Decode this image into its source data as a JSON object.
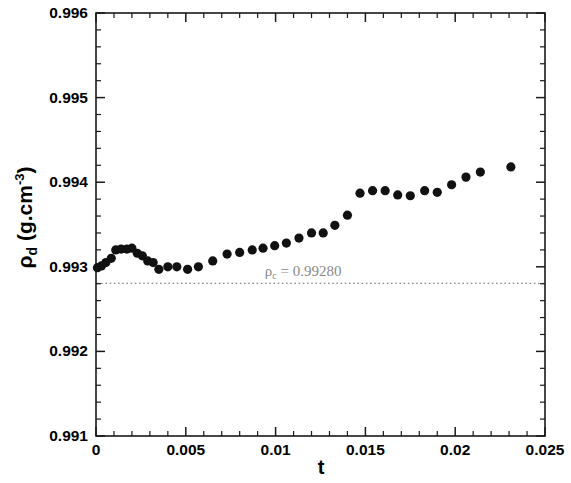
{
  "figure": {
    "background": "#ffffff",
    "frame_color": "#1a1a1a",
    "marker_color": "#111111",
    "annotation_color": "#8a8a8a"
  },
  "axes": {
    "y_label_rho": "ρ",
    "y_label_sub": "d",
    "y_label_unit": " (g.cm",
    "y_label_exp": "-3",
    "y_label_close": ")",
    "x_label": "t"
  },
  "annotation": {
    "rho_symbol": "ρ",
    "rho_sub": "c",
    "equals_value": " = 0.99280",
    "value": "0.99280",
    "x": 0.0094,
    "y": 0.992805
  },
  "chart_data": {
    "type": "scatter",
    "title": "",
    "xlabel": "t",
    "ylabel": "ρ_d (g.cm^-3)",
    "xlim": [
      0,
      0.025
    ],
    "ylim": [
      0.991,
      0.996
    ],
    "xticks": [
      0,
      0.005,
      0.01,
      0.015,
      0.02,
      0.025
    ],
    "xtick_labels": [
      "0",
      "0.005",
      "0.01",
      "0.015",
      "0.02",
      "0.025"
    ],
    "yticks": [
      0.991,
      0.992,
      0.993,
      0.994,
      0.995,
      0.996
    ],
    "ytick_labels": [
      "0.991",
      "0.992",
      "0.993",
      "0.994",
      "0.995",
      "0.996"
    ],
    "minor_ticks_per_interval": 5,
    "grid": false,
    "legend": null,
    "marker": "circle",
    "marker_size": 8,
    "hline": {
      "y": 0.992805,
      "style": "dotted",
      "color": "#8a8a8a",
      "label": "ρ_c = 0.99280"
    },
    "series": [
      {
        "name": "rho_d",
        "points": [
          [
            8e-05,
            0.99299
          ],
          [
            0.0003,
            0.99301
          ],
          [
            0.00055,
            0.99305
          ],
          [
            0.00085,
            0.9931
          ],
          [
            0.0011,
            0.9932
          ],
          [
            0.0014,
            0.99321
          ],
          [
            0.00172,
            0.99321
          ],
          [
            0.002,
            0.99322
          ],
          [
            0.0023,
            0.99316
          ],
          [
            0.00258,
            0.99313
          ],
          [
            0.00288,
            0.99307
          ],
          [
            0.00318,
            0.99305
          ],
          [
            0.0035,
            0.99297
          ],
          [
            0.004,
            0.993
          ],
          [
            0.0045,
            0.993
          ],
          [
            0.0051,
            0.99297
          ],
          [
            0.0057,
            0.993
          ],
          [
            0.0065,
            0.99307
          ],
          [
            0.0073,
            0.99315
          ],
          [
            0.008,
            0.99317
          ],
          [
            0.0087,
            0.9932
          ],
          [
            0.0093,
            0.99322
          ],
          [
            0.00995,
            0.99325
          ],
          [
            0.0106,
            0.99328
          ],
          [
            0.0113,
            0.99334
          ],
          [
            0.012,
            0.9934
          ],
          [
            0.01265,
            0.9934
          ],
          [
            0.0133,
            0.99349
          ],
          [
            0.014,
            0.99361
          ],
          [
            0.0147,
            0.99387
          ],
          [
            0.0154,
            0.9939
          ],
          [
            0.0161,
            0.9939
          ],
          [
            0.0168,
            0.99385
          ],
          [
            0.0175,
            0.99384
          ],
          [
            0.0183,
            0.9939
          ],
          [
            0.019,
            0.99388
          ],
          [
            0.0198,
            0.99397
          ],
          [
            0.0206,
            0.99406
          ],
          [
            0.0214,
            0.99412
          ],
          [
            0.0231,
            0.99418
          ]
        ]
      }
    ]
  }
}
